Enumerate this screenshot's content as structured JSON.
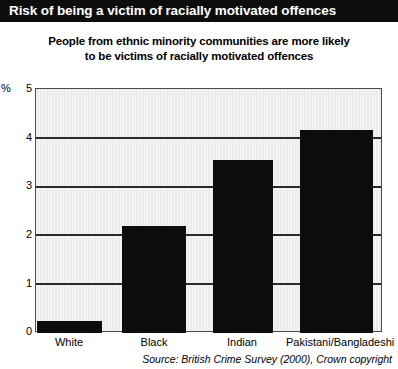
{
  "banner": {
    "title": "Risk of being a victim of racially motivated offences"
  },
  "subtitle": {
    "line1": "People from ethnic minority communities are more likely",
    "line2": "to be victims of racially motivated offences"
  },
  "axis": {
    "percent_symbol": "%",
    "ticks": [
      "5",
      "4",
      "3",
      "2",
      "1",
      "0"
    ]
  },
  "source": "Source: British Crime Survey (2000), Crown copyright",
  "colors": {
    "banner_background": "#0d0d0d",
    "banner_text": "#ffffff",
    "bar_fill": "#0d0d0d",
    "plot_background": "#ececec",
    "gridline": "#2b2b2b",
    "plot_border": "#4a4a4a"
  },
  "chart_data": {
    "type": "bar",
    "title": "Risk of being a victim of racially motivated offences",
    "subtitle": "People from ethnic minority communities are more likely to be victims of racially motivated offences",
    "categories": [
      "White",
      "Black",
      "Indian",
      "Pakistani/Bangladeshi"
    ],
    "values": [
      0.25,
      2.2,
      3.55,
      4.15
    ],
    "xlabel": "",
    "ylabel": "%",
    "ylim": [
      0,
      5
    ],
    "yticks": [
      0,
      1,
      2,
      3,
      4,
      5
    ],
    "grid": true,
    "legend": "none",
    "source": "Source: British Crime Survey (2000), Crown copyright"
  }
}
